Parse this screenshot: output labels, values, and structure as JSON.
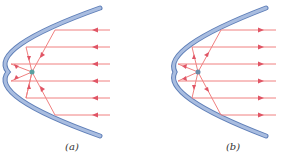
{
  "figure": {
    "panels": [
      {
        "id": "a",
        "label": "(a)",
        "direction": "incoming",
        "description": "Parallel rays incident on parabolic mirror converge at focus"
      },
      {
        "id": "b",
        "label": "(b)",
        "direction": "outgoing",
        "description": "Rays from focus reflect off parabolic mirror as parallel beam"
      }
    ],
    "rays_per_panel": 6,
    "ray_y_positions": [
      30,
      47,
      64,
      81,
      98,
      115
    ],
    "colors": {
      "mirror_fill": "#9db3da",
      "mirror_edge": "#5f7fb8",
      "ray": "#f08080",
      "arrow": "#e05565",
      "focus": "#5aa0a0"
    }
  }
}
